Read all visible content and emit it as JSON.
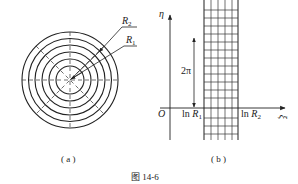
{
  "figure": {
    "caption": "图 14-6",
    "panel_a": {
      "label": "( a )",
      "r2_label": "R",
      "r2_sub": "2",
      "r1_label": "R",
      "r1_sub": "1",
      "circle_count": 6
    },
    "panel_b": {
      "label": "( b )",
      "y_axis_label": "η",
      "x_axis_label": "ξ",
      "origin_label": "O",
      "period_label": "2π",
      "ln_r1_prefix": "ln ",
      "ln_r1_var": "R",
      "ln_r1_sub": "1",
      "ln_r2_prefix": "ln ",
      "ln_r2_var": "R",
      "ln_r2_sub": "2"
    }
  }
}
